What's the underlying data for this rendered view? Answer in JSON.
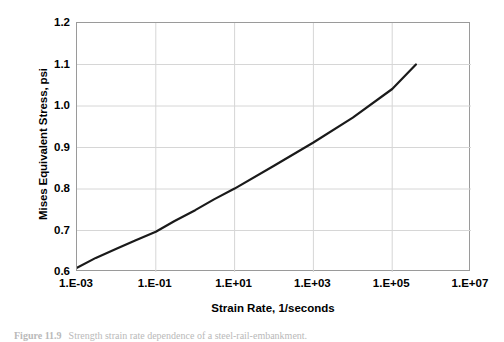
{
  "figure": {
    "caption_number": "Figure 11.9",
    "caption_text": "Strength strain rate dependence of a steel-rail-embankment."
  },
  "chart_data": {
    "type": "line",
    "title": "",
    "xlabel": "Strain Rate, 1/seconds",
    "ylabel": "Mises Equivalent Stress, psi",
    "xscale": "log",
    "yscale": "linear",
    "xlim": [
      0.001,
      10000000
    ],
    "ylim": [
      0.6,
      1.2
    ],
    "grid": true,
    "legend": false,
    "xticklabels": [
      "1.E-03",
      "1.E-01",
      "1.E+01",
      "1.E+03",
      "1.E+05",
      "1.E+07"
    ],
    "xtickvalues": [
      0.001,
      0.1,
      10,
      1000,
      100000,
      10000000
    ],
    "yticklabels": [
      "0.6",
      "0.7",
      "0.8",
      "0.9",
      "1.0",
      "1.1",
      "1.2"
    ],
    "ytickvalues": [
      0.6,
      0.7,
      0.8,
      0.9,
      1.0,
      1.1,
      1.2
    ],
    "series": [
      {
        "name": "Mises equivalent stress vs strain rate",
        "color": "#1a1a1a",
        "linewidth": 2.2,
        "x": [
          0.001,
          0.003,
          0.01,
          0.03,
          0.1,
          0.3,
          1,
          3,
          10,
          100,
          1000,
          10000,
          100000,
          400000
        ],
        "y": [
          0.61,
          0.634,
          0.656,
          0.676,
          0.697,
          0.723,
          0.749,
          0.775,
          0.801,
          0.856,
          0.912,
          0.972,
          1.041,
          1.1
        ]
      }
    ]
  },
  "axis": {
    "y_title": "Mises Equivalent Stress, psi",
    "x_title": "Strain Rate, 1/seconds"
  }
}
